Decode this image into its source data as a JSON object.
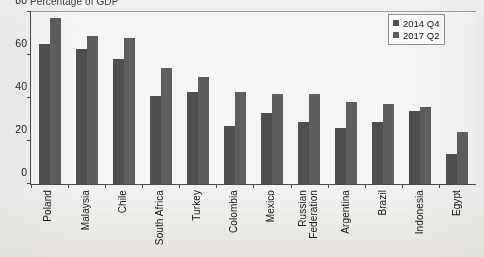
{
  "chart_data": {
    "type": "bar",
    "title": "Percentage of GDP",
    "xlabel": "",
    "ylabel": "",
    "ylim": [
      0,
      80
    ],
    "yticks": [
      0,
      20,
      40,
      60,
      80
    ],
    "grid": false,
    "legend_position": "top-right",
    "categories": [
      "Poland",
      "Malaysia",
      "Chile",
      "South Africa",
      "Turkey",
      "Colombia",
      "Mexico",
      "Russian\nFederation",
      "Argentina",
      "Brazil",
      "Indonesia",
      "Egypt"
    ],
    "series": [
      {
        "name": "2014 Q4",
        "color": "#4f4f51",
        "values": [
          65,
          63,
          58,
          41,
          43,
          27,
          33,
          29,
          26,
          29,
          34,
          14
        ]
      },
      {
        "name": "2017 Q2",
        "color": "#5e5e60",
        "values": [
          77,
          69,
          68,
          54,
          50,
          43,
          42,
          42,
          38,
          37,
          36,
          24
        ]
      }
    ]
  },
  "legend": {
    "items": [
      {
        "label": "2014 Q4"
      },
      {
        "label": "2017 Q2"
      }
    ]
  }
}
